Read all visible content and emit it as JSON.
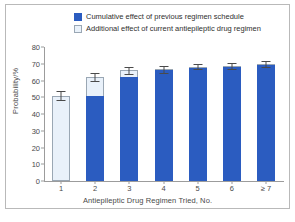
{
  "figure": {
    "border_color": "#b9b9b9",
    "background": "#ffffff"
  },
  "colors": {
    "dark_blue": "#2b5cc0",
    "light_blue": "#e9f1fa",
    "light_border": "#9aa7b4",
    "axis": "#9c9c9c",
    "text": "#4a4a4a"
  },
  "legend": {
    "position": "top-center",
    "entries": [
      {
        "label": "Cumulative effect of previous regimen schedule",
        "swatch": "dark",
        "color": "#2b5cc0"
      },
      {
        "label": "Additional effect of current antiepileptic drug regimen",
        "swatch": "light",
        "color": "#e9f1fa"
      }
    ]
  },
  "chart_data": {
    "type": "bar",
    "subtype": "stacked-bar-with-error-bars",
    "title": "",
    "subtitle": "",
    "xlabel": "Antiepileptic Drug Regimen Tried, No.",
    "ylabel": "Probability/%",
    "ylim": [
      0,
      80
    ],
    "yticks": [
      0,
      10,
      20,
      30,
      40,
      50,
      60,
      70,
      80
    ],
    "ytick_labels": [
      "0",
      "10",
      "20",
      "30",
      "40",
      "50",
      "60",
      "70",
      "80"
    ],
    "grid": false,
    "legend_position": "top-center",
    "categories": [
      "1",
      "2",
      "3",
      "4",
      "5",
      "6",
      "≥ 7"
    ],
    "series": [
      {
        "name": "Cumulative effect of previous regimen schedule",
        "color": "#2b5cc0",
        "values": [
          0,
          50.5,
          62,
          66,
          67.2,
          68,
          69
        ]
      },
      {
        "name": "Additional effect of current antiepileptic drug regimen",
        "color": "#e9f1fa",
        "values": [
          51,
          11.5,
          4,
          0.7,
          1,
          0.7,
          0.7
        ]
      }
    ],
    "totals": [
      51,
      62,
      66,
      66.7,
      68.2,
      68.7,
      69.7
    ],
    "error_bars": {
      "upper": [
        53.5,
        64.5,
        68.2,
        68.9,
        69.9,
        70.5,
        71.4
      ],
      "lower": [
        48.6,
        59.7,
        63.8,
        64.6,
        66.6,
        66.9,
        68.0
      ]
    }
  }
}
